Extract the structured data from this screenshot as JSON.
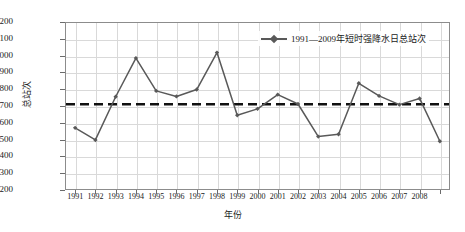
{
  "chart_data": {
    "type": "line",
    "title": "",
    "xlabel": "年份",
    "ylabel": "总站次",
    "ylim": [
      1200,
      2200
    ],
    "ytick_step": 100,
    "yticks": [
      2200,
      2100,
      2000,
      1900,
      1800,
      1700,
      1600,
      1500,
      1400,
      1300,
      1200
    ],
    "grid": true,
    "legend_position": "top-right",
    "x": [
      1991,
      1992,
      1993,
      1994,
      1995,
      1996,
      1997,
      1998,
      1999,
      2000,
      2001,
      2002,
      2003,
      2004,
      2005,
      2006,
      2007,
      2008,
      2009
    ],
    "xtick_labels": [
      "1991",
      "1992",
      "1993",
      "1994",
      "1995",
      "1996",
      "1997",
      "1998",
      "1999",
      "2000",
      "2001",
      "2002",
      "2003",
      "2004",
      "2005",
      "2006",
      "2007",
      "2008",
      ""
    ],
    "series": [
      {
        "name": "1991—2009年短时强降水日总站次",
        "color": "#595959",
        "marker": "diamond",
        "values": [
          1570,
          1498,
          1755,
          1985,
          1790,
          1757,
          1798,
          2018,
          1645,
          1683,
          1768,
          1712,
          1518,
          1532,
          1835,
          1760,
          1708,
          1745,
          1490
        ]
      }
    ],
    "reference_line": {
      "name": "平均值",
      "value": 1710,
      "style": "dashed",
      "color": "#111111"
    }
  },
  "legend": {
    "entries": [
      {
        "label": "1991—2009年短时强降水日总站次"
      }
    ]
  }
}
